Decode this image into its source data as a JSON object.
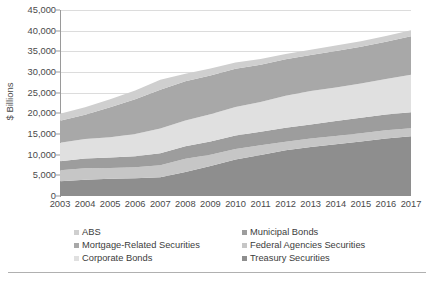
{
  "chart_data": {
    "type": "area",
    "stacked": true,
    "title": "",
    "subtitle": "",
    "xlabel": "",
    "ylabel": "$ Billions",
    "x": [
      2003,
      2004,
      2005,
      2006,
      2007,
      2008,
      2009,
      2010,
      2011,
      2012,
      2013,
      2014,
      2015,
      2016,
      2017
    ],
    "categories": [
      "2003",
      "2004",
      "2005",
      "2006",
      "2007",
      "2008",
      "2009",
      "2010",
      "2011",
      "2012",
      "2013",
      "2014",
      "2015",
      "2016",
      "2017"
    ],
    "ylim": [
      0,
      45000
    ],
    "yticks": [
      0,
      5000,
      10000,
      15000,
      20000,
      25000,
      30000,
      35000,
      40000,
      45000
    ],
    "ytick_labels": [
      "0",
      "5,000",
      "10,000",
      "15,000",
      "20,000",
      "25,000",
      "30,000",
      "35,000",
      "40,000",
      "45,000"
    ],
    "grid": true,
    "legend_position": "bottom",
    "legend_columns": 2,
    "stack_order_bottom_to_top": [
      "Treasury Securities",
      "Federal Agencies Securities",
      "Municipal Bonds",
      "Corporate Bonds",
      "Mortgage-Related Securities",
      "ABS"
    ],
    "series": [
      {
        "name": "Treasury Securities",
        "color": "#8e8e8e",
        "values": [
          3575,
          3944,
          4166,
          4322,
          4517,
          5787,
          7261,
          8853,
          9928,
          11046,
          11854,
          12505,
          13192,
          13908,
          14469
        ]
      },
      {
        "name": "Federal Agencies Securities",
        "color": "#c6c6c6",
        "values": [
          2637,
          2745,
          2614,
          2651,
          2933,
          3207,
          2727,
          2538,
          2326,
          2096,
          2058,
          1996,
          1995,
          1989,
          1935
        ]
      },
      {
        "name": "Municipal Bonds",
        "color": "#9d9d9d",
        "values": [
          2225,
          2377,
          2519,
          2660,
          2886,
          3066,
          3216,
          3270,
          3268,
          3380,
          3376,
          3624,
          3719,
          3828,
          3851
        ]
      },
      {
        "name": "Corporate Bonds",
        "color": "#e0e0e0",
        "values": [
          4462,
          4715,
          4940,
          5387,
          5972,
          6211,
          6591,
          6853,
          7249,
          7729,
          8099,
          8100,
          8291,
          8560,
          9100
        ]
      },
      {
        "name": "Mortgage-Related Securities",
        "color": "#a8a8a8",
        "values": [
          5309,
          5862,
          7208,
          8391,
          9372,
          9467,
          9349,
          9258,
          8999,
          8838,
          8721,
          8842,
          8894,
          9024,
          9304
        ]
      },
      {
        "name": "ABS",
        "color": "#cfcfcf",
        "values": [
          1693,
          1828,
          1955,
          2130,
          2472,
          1829,
          1712,
          1508,
          1359,
          1280,
          1286,
          1349,
          1376,
          1397,
          1465
        ]
      }
    ],
    "totals": [
      19901,
      21471,
      23402,
      25541,
      28152,
      29567,
      30856,
      32280,
      33129,
      34369,
      35394,
      36416,
      37467,
      38706,
      40124
    ]
  },
  "axis": {
    "y_title": "$ Billions"
  },
  "legend": {
    "items": [
      {
        "label": "ABS",
        "color": "#cfcfcf",
        "column": 0,
        "row": 0
      },
      {
        "label": "Mortgage-Related Securities",
        "color": "#a8a8a8",
        "column": 0,
        "row": 1
      },
      {
        "label": "Corporate Bonds",
        "color": "#e0e0e0",
        "column": 0,
        "row": 2
      },
      {
        "label": "Municipal Bonds",
        "color": "#9d9d9d",
        "column": 1,
        "row": 0
      },
      {
        "label": "Federal Agencies Securities",
        "color": "#c6c6c6",
        "column": 1,
        "row": 1
      },
      {
        "label": "Treasury Securities",
        "color": "#8e8e8e",
        "column": 1,
        "row": 2
      }
    ]
  },
  "colors": {
    "grid": "#dcdcdc",
    "axis": "#9a9a9a",
    "text": "#4a4a4a",
    "background": "#ffffff",
    "footer_rule": "#b0b0b0"
  }
}
